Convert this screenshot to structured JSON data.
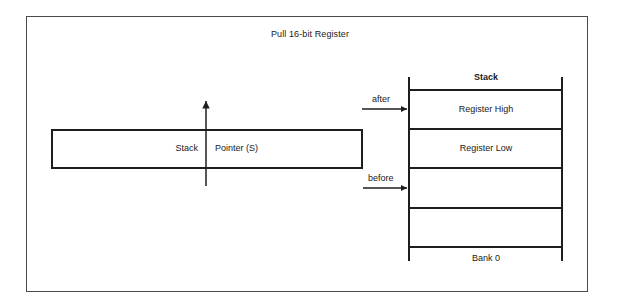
{
  "diagram": {
    "title": "Pull 16-bit Register",
    "stack_pointer": {
      "label_left": "Stack",
      "label_right": "Pointer (S)",
      "direction": "up"
    },
    "stack": {
      "title": "Stack",
      "cells": [
        {
          "label": "Register High"
        },
        {
          "label": "Register Low"
        },
        {
          "label": ""
        },
        {
          "label": ""
        }
      ],
      "footer": "Bank 0"
    },
    "pointers": {
      "after": "after",
      "before": "before"
    },
    "colors": {
      "line": "#1e1e1e",
      "frame": "#4a4a4a",
      "background": "#ffffff"
    }
  }
}
